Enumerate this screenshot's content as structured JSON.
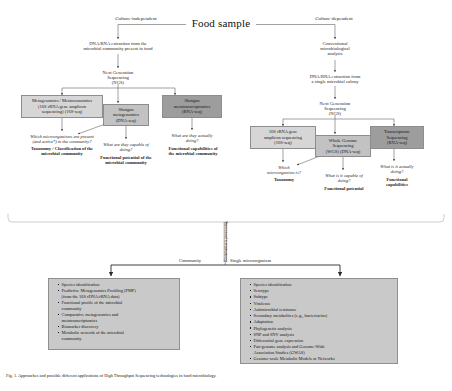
{
  "figure": {
    "title": "Food sample",
    "caption": "Fig. 1. Approaches and possible different applications of High Throughput Sequencing technologies in food microbiology."
  },
  "branches": {
    "left_label": "Culture-independent",
    "right_label": "Culture-dependent"
  },
  "left_track": {
    "extraction": "DNA/RNA extraction from the\nmicrobial community present in food",
    "ngs": "Next Generation\nSequencing\n(NGS)",
    "boxes": [
      {
        "id": "metagenomics-metataxonomics",
        "label": "Metagenomics / Metataxonomics\n(16S rRNA gene amplicon\nsequencing) (16S-seq)",
        "shade": "light"
      },
      {
        "id": "shotgun-metagenomics",
        "label": "Shotgun\nmetagenomics\n(DNA-seq)",
        "shade": "mid"
      },
      {
        "id": "shotgun-metatranscriptomics",
        "label": "Shotgun\nmetatranscriptomics\n(RNA-seq)",
        "shade": "dark"
      }
    ],
    "outcomes": [
      {
        "id": "taxonomy-community",
        "question": "Which microorganisms are present\n(and active*) in the community?",
        "answer": "Taxonomy / Classification of the\nmicrobial community"
      },
      {
        "id": "functional-potential-community",
        "question": "What are they capable of\ndoing?",
        "answer": "Functional potential of the\nmicrobial community"
      },
      {
        "id": "functional-capabilities-community",
        "question": "What are they actually\ndoing?",
        "answer": "Functional capabilities of\nthe microbial community"
      }
    ]
  },
  "right_track": {
    "conventional": "Conventional\nmicrobiological\nanalysis",
    "extraction": "DNA/RNA extraction from\na single microbial colony",
    "ngs": "Next Generation\nSequencing\n(NGS)",
    "boxes": [
      {
        "id": "16s-amplicon-sequencing",
        "label": "16S rRNA gene\namplicon sequencing\n(16S-seq)",
        "shade": "light"
      },
      {
        "id": "whole-genome-sequencing",
        "label": "Whole Genome\nSequencing\n(WGS) (DNA-seq)",
        "shade": "mid"
      },
      {
        "id": "transcriptome-sequencing",
        "label": "Transcriptome\nSequencing\n(RNA-seq)",
        "shade": "dark"
      }
    ],
    "outcomes": [
      {
        "id": "taxonomy-single",
        "question": "Which\nmicroorganism is?",
        "answer": "Taxonomy"
      },
      {
        "id": "functional-potential-single",
        "question": "What is it capable of\ndoing?",
        "answer": "Functional potential"
      },
      {
        "id": "functional-capabilities-single",
        "question": "What is it actually\ndoing?",
        "answer": "Functional\ncapabilities"
      }
    ]
  },
  "bioinformatics": {
    "vertical_label": "Bioinformatic processing",
    "left_label": "Community",
    "right_label": "Single microorganism"
  },
  "applications": {
    "community": [
      "Species identification",
      "Predictive Metagenomics Profiling (PMP)\n(from the 16S rDNA/rRNA data)",
      "Functional profile of the microbial\ncommunity",
      "Comparative metagenomics and\nmetatranscriptomics",
      "Biomarker discovery",
      "Metabolic network of the microbial\ncommunity"
    ],
    "single": [
      "Species identification",
      "Serotype",
      "Subtype",
      "Virulence",
      "Antimicrobial resistance",
      "Secondary metabolites (e.g., bacteriocins)",
      "Adaptation",
      "Phylogenetic analysis",
      "SNP and SNV analysis",
      "Differential gene expression",
      "Pan-genome analysis and Genome-Wide\nAssociation Studies (GWAS)",
      "Genome-scale Metabolic Models or Networks"
    ]
  },
  "colors": {
    "box_light": "#d6d6d6",
    "box_mid": "#c2c2c2",
    "box_dark": "#9d9d9d",
    "panel": "#c9c9c9",
    "stroke": "#555555"
  }
}
